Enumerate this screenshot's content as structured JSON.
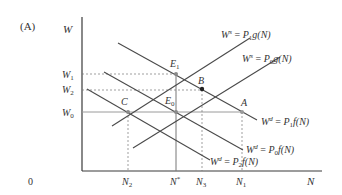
{
  "panel_label": "(A)",
  "axes": {
    "y_label": "W",
    "x_label": "N",
    "origin": "0"
  },
  "y_ticks": [
    {
      "name": "W1",
      "base": "W",
      "sub": "1"
    },
    {
      "name": "W2",
      "base": "W",
      "sub": "2"
    },
    {
      "name": "W0",
      "base": "W",
      "sub": "0"
    }
  ],
  "x_ticks": [
    {
      "name": "N2",
      "base": "N",
      "sub": "2",
      "sup": ""
    },
    {
      "name": "N*",
      "base": "N",
      "sub": "",
      "sup": "*"
    },
    {
      "name": "N3",
      "base": "N",
      "sub": "3",
      "sup": ""
    },
    {
      "name": "N1",
      "base": "N",
      "sub": "1",
      "sup": ""
    }
  ],
  "points": {
    "E1": {
      "base": "E",
      "sub": "1"
    },
    "B": {
      "base": "B",
      "sub": ""
    },
    "E0": {
      "base": "E",
      "sub": "0"
    },
    "A": {
      "base": "A",
      "sub": ""
    },
    "C": {
      "base": "C",
      "sub": ""
    }
  },
  "curves": {
    "supply_p1": {
      "lhs": "W",
      "lhs_sup": "s",
      "eq": " = ",
      "rhs_p": "P",
      "rhs_sub": "1",
      "rhs_fn": "g(N)"
    },
    "supply_p0": {
      "lhs": "W",
      "lhs_sup": "s",
      "eq": " = ",
      "rhs_p": "P",
      "rhs_sub": "0",
      "rhs_fn": "g(N)"
    },
    "demand_p1": {
      "lhs": "W",
      "lhs_sup": "d",
      "eq": " = ",
      "rhs_p": "P",
      "rhs_sub": "1",
      "rhs_fn": "f(N)"
    },
    "demand_p0": {
      "lhs": "W",
      "lhs_sup": "d",
      "eq": " = ",
      "rhs_p": "P",
      "rhs_sub": "0",
      "rhs_fn": "f(N)"
    },
    "demand_p2": {
      "lhs": "W",
      "lhs_sup": "d",
      "eq": " = ",
      "rhs_p": "P",
      "rhs_sub": "2",
      "rhs_fn": "f(N)"
    }
  },
  "colors": {
    "line": "#4a4a4a",
    "axis": "#3a3a3a",
    "guide": "#777777",
    "w0_line": "#9a9a9a",
    "point": "#8a8a8a",
    "point_b": "#222222"
  }
}
